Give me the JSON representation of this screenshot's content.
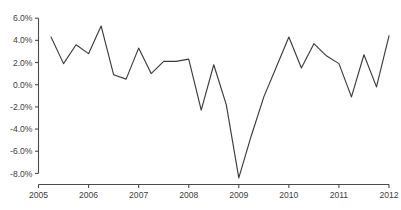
{
  "chart_data": {
    "type": "line",
    "title": "",
    "subtitle": "",
    "xlabel": "",
    "ylabel": "",
    "grid": false,
    "legend": false,
    "legend_position": "none",
    "xlim": [
      2005.0,
      2012.0
    ],
    "ylim": [
      -9.0,
      6.6
    ],
    "yticks": [
      6,
      4,
      2,
      0,
      -2,
      -4,
      -6,
      -8
    ],
    "ytick_labels": [
      "6.0%",
      "4.0%",
      "2.0%",
      "0.0%",
      "-2.0%",
      "-4.0%",
      "-6.0%",
      "-8.0%"
    ],
    "xticks": [
      2005,
      2006,
      2007,
      2008,
      2009,
      2010,
      2011,
      2012
    ],
    "xtick_labels": [
      "2005",
      "2006",
      "2007",
      "2008",
      "2009",
      "2010",
      "2011",
      "2012"
    ],
    "value_suffix": "%",
    "line_color": "#3b3b3b",
    "axis_color": "#4a4a4a",
    "background_color": "#ffffff",
    "series": [
      {
        "name": "series-1",
        "x": [
          2005.25,
          2005.5,
          2005.75,
          2006.0,
          2006.25,
          2006.5,
          2006.75,
          2007.0,
          2007.25,
          2007.5,
          2007.75,
          2008.0,
          2008.25,
          2008.5,
          2008.75,
          2009.0,
          2009.25,
          2009.5,
          2009.75,
          2010.0,
          2010.25,
          2010.5,
          2010.75,
          2011.0,
          2011.25,
          2011.5,
          2011.75,
          2012.0
        ],
        "values": [
          4.3,
          1.9,
          3.6,
          2.8,
          5.3,
          0.9,
          0.5,
          3.3,
          1.0,
          2.1,
          2.1,
          2.3,
          -2.3,
          1.8,
          -1.8,
          -8.4,
          -4.6,
          -1.1,
          1.6,
          4.3,
          1.5,
          3.7,
          2.6,
          1.9,
          -1.1,
          2.7,
          -0.2,
          4.4
        ]
      }
    ]
  }
}
